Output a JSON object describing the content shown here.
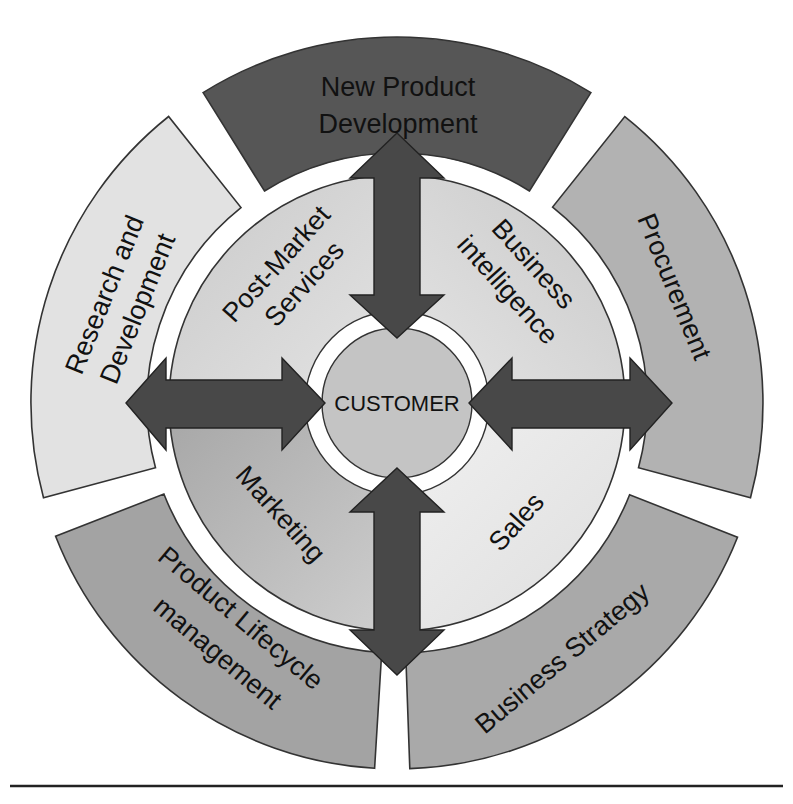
{
  "diagram": {
    "center": {
      "label": "CUSTOMER",
      "color": "#c4c4c4"
    },
    "outer_ring": [
      {
        "id": "new-product-development",
        "lines": [
          "New Product",
          "Development"
        ],
        "color": "#565656",
        "start_deg": -32,
        "end_deg": 32
      },
      {
        "id": "procurement",
        "lines": [
          "Procurement"
        ],
        "color": "#b2b2b2",
        "start_deg": 38.5,
        "end_deg": 105
      },
      {
        "id": "business-strategy",
        "lines": [
          "Business Strategy"
        ],
        "color": "#a9a9a9",
        "start_deg": 111.5,
        "end_deg": 177.5
      },
      {
        "id": "product-lifecycle-management",
        "lines": [
          "Product Lifecycle",
          "management"
        ],
        "color": "#a3a3a3",
        "start_deg": 183.5,
        "end_deg": 248.5
      },
      {
        "id": "research-and-development",
        "lines": [
          "Research and",
          "Development"
        ],
        "color": "#e2e2e2",
        "start_deg": 255,
        "end_deg": 321.5
      }
    ],
    "middle_ring": [
      {
        "id": "post-market-services",
        "lines": [
          "Post-Market",
          "Services"
        ],
        "color": "#d6d6d6"
      },
      {
        "id": "business-intelligence",
        "lines": [
          "Business",
          "intelligence"
        ],
        "color": "#dcdcdc"
      },
      {
        "id": "sales",
        "lines": [
          "Sales"
        ],
        "color": "#e6e6e6"
      },
      {
        "id": "marketing",
        "lines": [
          "Marketing"
        ],
        "color": "#b4b4b4"
      }
    ],
    "arrows": [
      "up-down-top",
      "left-right-left",
      "left-right-right",
      "up-down-bottom"
    ],
    "arrow_color": "#484848"
  }
}
